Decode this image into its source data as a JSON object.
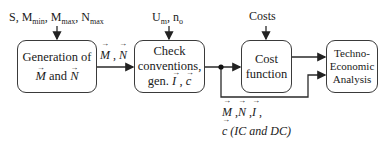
{
  "inputs": {
    "generation": {
      "parts": [
        "S, M",
        "min",
        ", M",
        "max",
        ", N",
        "max"
      ]
    },
    "check": {
      "parts": [
        "U",
        "m",
        ", n",
        "o"
      ]
    },
    "cost": "Costs"
  },
  "boxes": {
    "generation": {
      "line1": "Generation of",
      "v1": "M",
      "and": " and ",
      "v2": "N"
    },
    "check": {
      "line1": "Check",
      "line2": "conventions,",
      "gen": "gen. ",
      "v1": "I",
      "sep": " , ",
      "v2": "c"
    },
    "cost": {
      "line1": "Cost",
      "line2": "function"
    },
    "tea": {
      "line1": "Techno-",
      "line2": "Economic",
      "line3": "Analysis"
    }
  },
  "edges": {
    "gen_to_check": {
      "v1": "M",
      "sep": " , ",
      "v2": "N"
    },
    "feedback": {
      "v1": "M",
      "s1": " ,",
      "v2": "N",
      "s2": " ,",
      "v3": "I",
      "s3": " ,",
      "v4": "c",
      "note": " (IC and DC)"
    }
  }
}
